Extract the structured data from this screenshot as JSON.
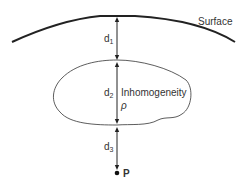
{
  "labels": {
    "surface": "Surface",
    "d1": "d",
    "d1_sub": "1",
    "d2": "d",
    "d2_sub": "2",
    "d3": "d",
    "d3_sub": "3",
    "inhomogeneity": "Inhomogeneity",
    "density": "ρ",
    "point": "P"
  },
  "colors": {
    "line": "#222222",
    "text": "#333333"
  }
}
